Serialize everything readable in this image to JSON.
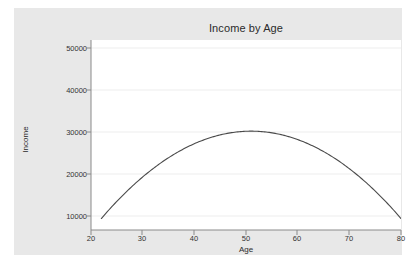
{
  "chart_data": {
    "type": "line",
    "title": "Income by Age",
    "xlabel": "Age",
    "ylabel": "Income",
    "xlim": [
      20,
      80
    ],
    "ylim": [
      7000,
      52000
    ],
    "grid": true,
    "legend": null,
    "xticks": [
      20,
      30,
      40,
      50,
      60,
      70,
      80
    ],
    "xtick_labels": [
      "20",
      "30",
      "40",
      "50",
      "60",
      "70",
      "80"
    ],
    "yticks": [
      10000,
      20000,
      30000,
      40000,
      50000
    ],
    "ytick_labels": [
      "10000",
      "20000",
      "30000",
      "40000",
      "50000"
    ],
    "series": [
      {
        "name": "Income",
        "color": "#4a4a4a",
        "x": [
          22,
          24,
          26,
          28,
          30,
          32,
          34,
          36,
          38,
          40,
          42,
          44,
          46,
          48,
          50,
          51,
          52,
          54,
          56,
          58,
          60,
          62,
          64,
          66,
          68,
          70,
          72,
          74,
          76,
          78,
          80
        ],
        "y": [
          10800,
          12650,
          14400,
          16050,
          17600,
          19050,
          20400,
          21650,
          22800,
          23850,
          24800,
          25650,
          26400,
          27050,
          27600,
          27840,
          28050,
          28400,
          28650,
          28800,
          28850,
          28800,
          28650,
          28400,
          28050,
          27600,
          27050,
          26400,
          25650,
          24800,
          23850
        ]
      }
    ],
    "curve": {
      "description": "Concave-down quadratic peaking near age 51",
      "peak_age": 51,
      "peak_income": 30200,
      "start_age": 22,
      "start_income": 10800,
      "end_age": 80,
      "end_income": 8000
    }
  },
  "style": {
    "figure_background": "#ffffff",
    "canvas_background": "#e8e8e8",
    "plot_background": "#ffffff",
    "gridline_color": "#ebebeb",
    "axis_color": "#7a7a7a",
    "line_color": "#4a4a4a",
    "text_color": "#333333"
  }
}
